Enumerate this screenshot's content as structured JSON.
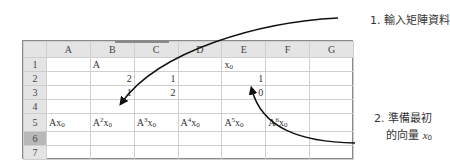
{
  "spreadsheet": {
    "columns": [
      "A",
      "B",
      "C",
      "D",
      "E",
      "F",
      "G"
    ],
    "rows": [
      {
        "label": "1",
        "cells": [
          "",
          "A",
          "",
          "",
          "x0",
          "",
          ""
        ]
      },
      {
        "label": "2",
        "cells": [
          "",
          "2",
          "1",
          "",
          "1",
          "",
          ""
        ]
      },
      {
        "label": "3",
        "cells": [
          "",
          "1",
          "2",
          "",
          "0",
          "",
          ""
        ]
      },
      {
        "label": "4",
        "cells": [
          "",
          "",
          "",
          "",
          "",
          "",
          ""
        ]
      },
      {
        "label": "5",
        "cells": [
          "Ax0",
          "A2x0",
          "A3x0",
          "A4x0",
          "A5x0",
          "A6x0",
          ""
        ]
      },
      {
        "label": "6",
        "cells": [
          "",
          "",
          "",
          "",
          "",
          "",
          ""
        ],
        "selected": true
      },
      {
        "label": "7",
        "cells": [
          "",
          "",
          "",
          "",
          "",
          "",
          ""
        ]
      }
    ],
    "row5_parts": [
      {
        "base": "A",
        "exp": "",
        "var": "x",
        "sub": "0"
      },
      {
        "base": "A",
        "exp": "2",
        "var": "x",
        "sub": "0"
      },
      {
        "base": "A",
        "exp": "3",
        "var": "x",
        "sub": "0"
      },
      {
        "base": "A",
        "exp": "4",
        "var": "x",
        "sub": "0"
      },
      {
        "base": "A",
        "exp": "5",
        "var": "x",
        "sub": "0"
      },
      {
        "base": "A",
        "exp": "6",
        "var": "x",
        "sub": "0"
      }
    ],
    "e1": {
      "var": "x",
      "sub": "0"
    }
  },
  "annotations": {
    "step1": "1. 輸入矩陣資料",
    "step2_line1": "2. 準備最初",
    "step2_line2": "的向量",
    "step2_var": "x",
    "step2_sub": "0"
  }
}
